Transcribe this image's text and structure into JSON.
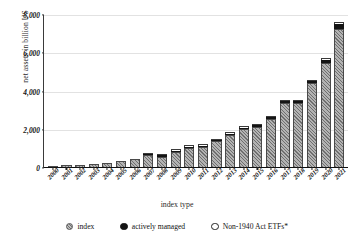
{
  "chart_data": {
    "type": "bar",
    "stacked": true,
    "title": "",
    "xlabel": "index type",
    "ylabel": "net assets in billion US",
    "ylim": [
      0,
      8000
    ],
    "yticks": [
      0,
      2000,
      4000,
      6000,
      8000
    ],
    "ytick_labels": [
      "0",
      "2,000",
      "4,000",
      "6,000",
      "8,000"
    ],
    "grid": true,
    "legend_position": "bottom",
    "categories": [
      "2000",
      "2001",
      "2002",
      "2003",
      "2004",
      "2005",
      "2006",
      "2007",
      "2008",
      "2009",
      "2010",
      "2011",
      "2012",
      "2013",
      "2014",
      "2015",
      "2016",
      "2017",
      "2018",
      "2019",
      "2020",
      "2021"
    ],
    "series": [
      {
        "name": "index",
        "color": "#a8a8a8",
        "pattern": "diagonal-hatch",
        "values": [
          66,
          83,
          102,
          151,
          228,
          301,
          423,
          608,
          531,
          777,
          991,
          1048,
          1337,
          1675,
          1975,
          2100,
          2524,
          3371,
          3371,
          4396,
          5449,
          7191
        ]
      },
      {
        "name": "actively managed",
        "color": "#141414",
        "values": [
          0,
          0,
          0,
          0,
          0,
          0,
          0,
          2,
          3,
          4,
          5,
          6,
          8,
          12,
          16,
          21,
          27,
          45,
          62,
          100,
          172,
          293
        ]
      },
      {
        "name": "Non-1940 Act ETFs*",
        "color": "#ffffff",
        "values": [
          0,
          0,
          0,
          0,
          0,
          0,
          0,
          14,
          20,
          24,
          30,
          36,
          42,
          48,
          53,
          58,
          64,
          70,
          74,
          80,
          88,
          96
        ]
      }
    ],
    "totals": [
      66,
      83,
      102,
      151,
      228,
      301,
      423,
      624,
      554,
      805,
      1026,
      1090,
      1387,
      1735,
      2044,
      2179,
      2615,
      3486,
      3507,
      4576,
      5709,
      7580
    ]
  },
  "legend": {
    "items": [
      {
        "label": "index",
        "marker": "hatched-circle"
      },
      {
        "label": "actively managed",
        "marker": "filled-circle"
      },
      {
        "label": "Non-1940 Act ETFs*",
        "marker": "outline-circle"
      }
    ]
  }
}
